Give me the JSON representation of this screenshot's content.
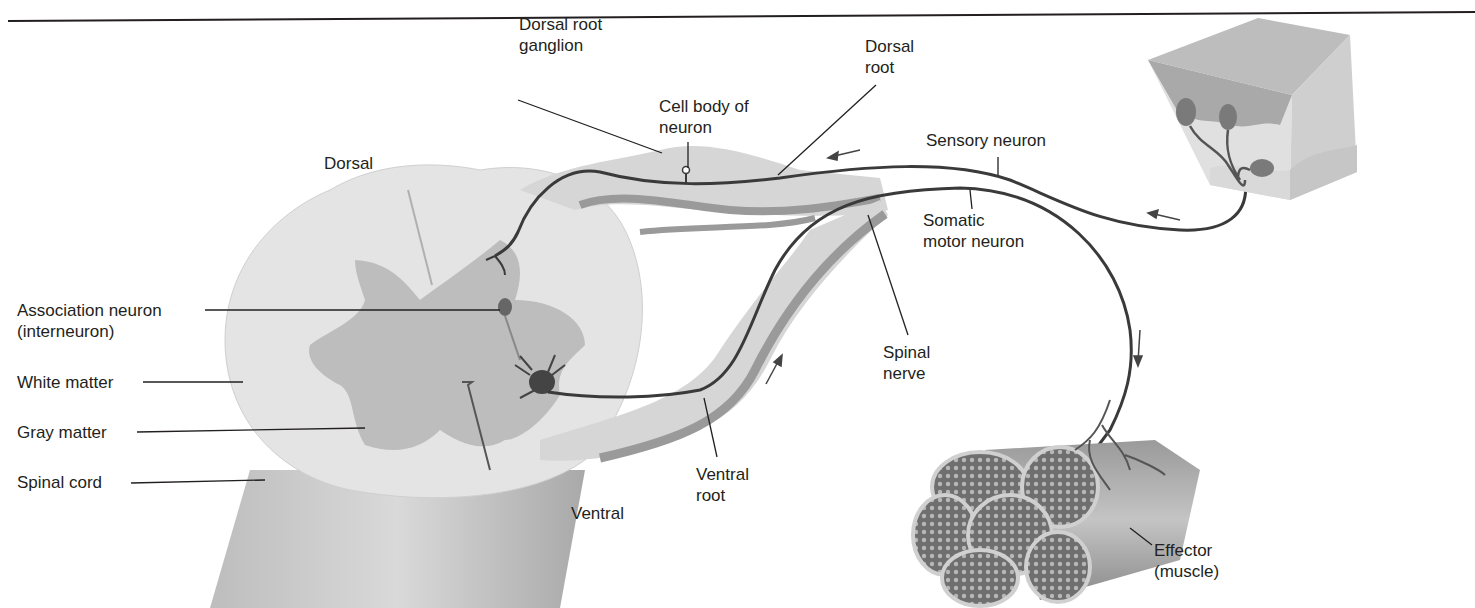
{
  "figure": {
    "type": "reflex-arc-diagram",
    "colors": {
      "background": "#ffffff",
      "white_matter": "#e4e4e4",
      "gray_matter": "#bdbdbd",
      "nerve_light": "#d6d6d6",
      "nerve_dark": "#9a9a9a",
      "neuron_line": "#3a3a3a",
      "label_text": "#231f20",
      "leader_line": "#231f20"
    },
    "labels": {
      "dorsal_root_ganglion": "Dorsal root\nganglion",
      "cell_body_of_neuron": "Cell body of\nneuron",
      "dorsal_root": "Dorsal\nroot",
      "sensory_neuron": "Sensory neuron",
      "somatic_motor_neuron": "Somatic\nmotor neuron",
      "dorsal": "Dorsal",
      "association_neuron": "Association neuron\n(interneuron)",
      "white_matter": "White matter",
      "gray_matter": "Gray matter",
      "spinal_cord": "Spinal cord",
      "spinal_nerve": "Spinal\nnerve",
      "ventral_root": "Ventral\nroot",
      "ventral": "Ventral",
      "effector": "Effector\n(muscle)"
    },
    "structures": [
      "spinal-cord",
      "dorsal-root-ganglion",
      "spinal-nerve",
      "skin-receptor-block",
      "muscle-bundle"
    ],
    "arrows": [
      {
        "near": "dorsal-root",
        "direction": "left"
      },
      {
        "near": "sensory-neuron-skin",
        "direction": "left"
      },
      {
        "near": "ventral-root",
        "direction": "up-right"
      },
      {
        "near": "somatic-motor-neuron",
        "direction": "down"
      }
    ]
  }
}
